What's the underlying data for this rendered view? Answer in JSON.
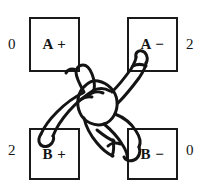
{
  "figure": {
    "caption": "",
    "background_color": "#ffffff",
    "line_color": "#1a1a1a",
    "text_color": "#141414"
  },
  "quadrants": [
    {
      "id": "a-plus",
      "label": "A +",
      "score": "0",
      "position": "top-left",
      "score_side": "left"
    },
    {
      "id": "a-minus",
      "label": "A −",
      "score": "2",
      "position": "top-right",
      "score_side": "right"
    },
    {
      "id": "b-plus",
      "label": "B +",
      "score": "2",
      "position": "bottom-left",
      "score_side": "left"
    },
    {
      "id": "b-minus",
      "label": "B −",
      "score": "0",
      "position": "bottom-right",
      "score_side": "right"
    }
  ],
  "sketch": {
    "name": "hand-drawn-figure-sketch",
    "description": "hand drawn outline of a figure with limbs extending diagonally toward the A-plus, A-minus and B-plus boxes"
  }
}
